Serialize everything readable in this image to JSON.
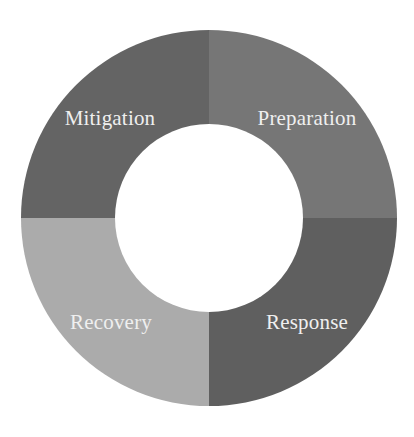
{
  "diagram": {
    "type": "donut-cycle",
    "center": [
      209,
      218
    ],
    "outer_radius": 188,
    "inner_radius": 94,
    "background": "#ffffff",
    "segments": [
      {
        "label": "Mitigation",
        "position": "top-left",
        "color": "#646464",
        "label_x": 110,
        "label_y": 125
      },
      {
        "label": "Preparation",
        "position": "top-right",
        "color": "#767676",
        "label_x": 307,
        "label_y": 125
      },
      {
        "label": "Response",
        "position": "bottom-right",
        "color": "#5f5f5f",
        "label_x": 307,
        "label_y": 329
      },
      {
        "label": "Recovery",
        "position": "bottom-left",
        "color": "#ababab",
        "label_x": 111,
        "label_y": 329
      }
    ],
    "label_color": "#efefef"
  }
}
